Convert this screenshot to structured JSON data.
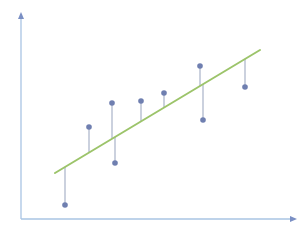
{
  "chart_data": {
    "type": "scatter",
    "title": "",
    "xlabel": "",
    "ylabel": "",
    "grid": false,
    "legend": null,
    "points": [
      {
        "x": 65,
        "y": 205
      },
      {
        "x": 89,
        "y": 127
      },
      {
        "x": 112,
        "y": 103
      },
      {
        "x": 115,
        "y": 163
      },
      {
        "x": 141,
        "y": 101
      },
      {
        "x": 164,
        "y": 93
      },
      {
        "x": 200,
        "y": 66
      },
      {
        "x": 203,
        "y": 120
      },
      {
        "x": 245,
        "y": 87
      }
    ],
    "regression_line": {
      "x1": 55,
      "y1": 173,
      "x2": 260,
      "y2": 50
    },
    "axes": {
      "origin": {
        "x": 21,
        "y": 219
      },
      "y_axis_top": {
        "x": 21,
        "y": 12
      },
      "x_axis_right": {
        "x": 297,
        "y": 219
      }
    }
  },
  "colors": {
    "axis": "#a9c4e3",
    "axis_arrow": "#7a8fc4",
    "regression_line": "#9cc46a",
    "point": "#6f7fb0",
    "residual": "#a8b3c8"
  }
}
